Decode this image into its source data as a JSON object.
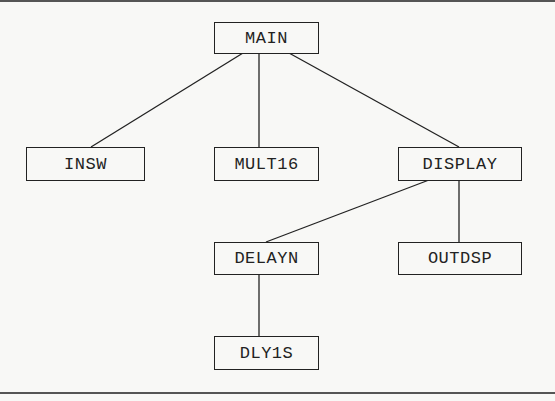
{
  "diagram": {
    "type": "module-hierarchy",
    "nodes": [
      {
        "id": "main",
        "label": "MAIN",
        "x": 214,
        "y": 22,
        "w": 105,
        "h": 32
      },
      {
        "id": "insw",
        "label": "INSW",
        "x": 26,
        "y": 147,
        "w": 119,
        "h": 34
      },
      {
        "id": "mult16",
        "label": "MULT16",
        "x": 214,
        "y": 147,
        "w": 105,
        "h": 34
      },
      {
        "id": "display",
        "label": "DISPLAY",
        "x": 398,
        "y": 147,
        "w": 124,
        "h": 34
      },
      {
        "id": "delayn",
        "label": "DELAYN",
        "x": 214,
        "y": 242,
        "w": 105,
        "h": 33
      },
      {
        "id": "outdsp",
        "label": "OUTDSP",
        "x": 398,
        "y": 242,
        "w": 124,
        "h": 33
      },
      {
        "id": "dly1s",
        "label": "DLY1S",
        "x": 214,
        "y": 336,
        "w": 105,
        "h": 34
      }
    ],
    "edges": [
      {
        "from": "MAIN",
        "to": "INSW"
      },
      {
        "from": "MAIN",
        "to": "MULT16"
      },
      {
        "from": "MAIN",
        "to": "DISPLAY"
      },
      {
        "from": "DISPLAY",
        "to": "DELAYN"
      },
      {
        "from": "DISPLAY",
        "to": "OUTDSP"
      },
      {
        "from": "DELAYN",
        "to": "DLY1S"
      }
    ],
    "colors": {
      "line": "#222222",
      "background": "#f8f8f6"
    }
  }
}
